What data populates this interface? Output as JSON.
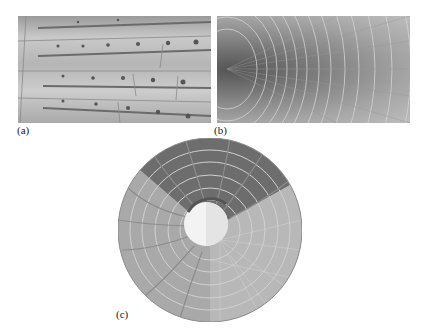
{
  "figure": {
    "panels": [
      {
        "id": "a",
        "label": "(a)",
        "subject": "segmented tunnel lining wall with bolt holes (photograph)"
      },
      {
        "id": "b",
        "label": "(b)",
        "subject": "circular tunnel interior with concentric ring segments (photograph)"
      },
      {
        "id": "c",
        "label": "(c)",
        "subject": "circular tunnel cross-section rendering with rib/grid pattern and light center"
      }
    ],
    "colors": {
      "background": "#ffffff",
      "photo_gray_dark": "#555555",
      "photo_gray_light": "#cdcdcd",
      "disc_base": "#a8a8a8",
      "disc_dark_sector": "#6a6a6a",
      "center_light": "#f2f2f2"
    }
  }
}
